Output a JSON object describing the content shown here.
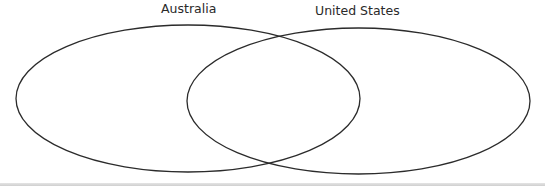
{
  "diagram": {
    "type": "venn",
    "sets": [
      {
        "label": "Australia",
        "cx": 188,
        "cy": 98.5,
        "rx": 172,
        "ry": 73.5
      },
      {
        "label": "United States",
        "cx": 358.5,
        "cy": 101,
        "rx": 171.5,
        "ry": 73
      }
    ],
    "stroke_color": "#2b2b2b",
    "background": "#ffffff"
  }
}
